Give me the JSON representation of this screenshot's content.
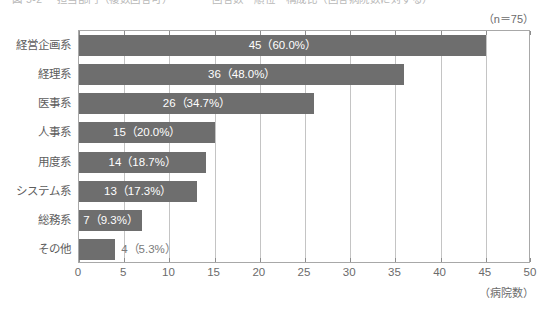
{
  "caption": "図 5-2 　担当部門（複数回答可）　　　　 回答数　順位　構成比（回答病院数に対する）",
  "sample_note": "（n＝75）",
  "axis_unit_label": "（病院数）",
  "colors": {
    "bar": "#6e6e6e",
    "grid": "#c4c4c4",
    "frame": "#a8a8a8",
    "label_text": "#5d5d5d",
    "value_inside": "#ffffff",
    "value_outside": "#7a7a7a"
  },
  "chart_data": {
    "type": "bar",
    "orientation": "horizontal",
    "title": "",
    "xlabel": "（病院数）",
    "ylabel": "",
    "xlim": [
      0,
      50
    ],
    "xticks": [
      0,
      5,
      10,
      15,
      20,
      25,
      30,
      35,
      40,
      45,
      50
    ],
    "xtick_labels": [
      "0",
      "5",
      "10",
      "15",
      "20",
      "25",
      "30",
      "35",
      "40",
      "45",
      "50"
    ],
    "grid": true,
    "legend": false,
    "n": 75,
    "annotation": "（n＝75）",
    "categories": [
      "経営企画系",
      "経理系",
      "医事系",
      "人事系",
      "用度系",
      "システム系",
      "総務系",
      "その他"
    ],
    "values": [
      45,
      36,
      26,
      15,
      14,
      13,
      7,
      4
    ],
    "percents": [
      60.0,
      48.0,
      34.7,
      20.0,
      18.7,
      17.3,
      9.3,
      5.3
    ],
    "data_labels": [
      "45（60.0%）",
      "36（48.0%）",
      "26（34.7%）",
      "15（20.0%）",
      "14（18.7%）",
      "13（17.3%）",
      "7（9.3%）",
      "4（5.3%）"
    ],
    "label_placement": [
      "inside",
      "inside",
      "inside",
      "inside",
      "inside",
      "inside",
      "inside",
      "outside"
    ]
  }
}
